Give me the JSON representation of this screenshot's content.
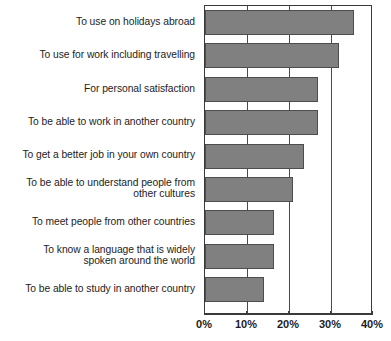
{
  "chart_data": {
    "type": "bar",
    "orientation": "horizontal",
    "title": "",
    "subtitle": "",
    "xlabel": "",
    "ylabel": "",
    "xlim": [
      0,
      40
    ],
    "xtick_labels": [
      "0%",
      "10%",
      "20%",
      "30%",
      "40%"
    ],
    "xtick_values": [
      0,
      10,
      20,
      30,
      40
    ],
    "grid": true,
    "grid_axis": "x",
    "legend": false,
    "legend_position": "none",
    "value_unit": "%",
    "bar_color": "#808080",
    "bar_border_color": "#4d4d4d",
    "axis_color": "#3a3a3a",
    "background_color": "#ffffff",
    "categories": [
      "To use on holidays abroad",
      "To use for work including travelling",
      "For personal satisfaction",
      "To be able to work in another country",
      "To get a better job in your own country",
      "To be able to understand people from\nother cultures",
      "To meet people from other countries",
      "To know a language that is widely\nspoken around the world",
      "To be able to study in another country"
    ],
    "values": [
      35.5,
      32,
      27,
      27,
      23.5,
      21,
      16.5,
      16.5,
      14
    ]
  }
}
